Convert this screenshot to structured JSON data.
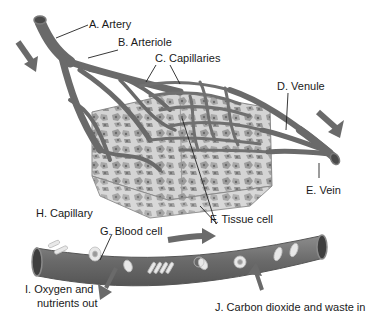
{
  "diagram": {
    "colors": {
      "vessel": "#6e6e6e",
      "vessel_dark": "#4a4a4a",
      "vessel_light": "#8a8a8a",
      "tissue_fill": "#c9c9c9",
      "tissue_cell": "#9a9a9a",
      "arrow": "#6a6a6a",
      "blood_cell": "#e6e6e6",
      "label_text": "#1a1a1a",
      "leader_line": "#222222"
    },
    "labels": {
      "artery": "A. Artery",
      "arteriole": "B. Arteriole",
      "capillaries": "C. Capillaries",
      "venule": "D. Venule",
      "vein": "E. Vein",
      "tissue_cell": "F. Tissue cell",
      "blood_cell": "G. Blood cell",
      "capillary": "H. Capillary",
      "oxygen_line1": "I.  Oxygen and",
      "oxygen_line2": "nutrients out",
      "carbon": "J. Carbon dioxide and waste in"
    },
    "arrows": [
      {
        "name": "inflow-arrow",
        "direction": "down-right"
      },
      {
        "name": "outflow-arrow",
        "direction": "down-right"
      },
      {
        "name": "capillary-flow-arrow",
        "direction": "right"
      },
      {
        "name": "oxygen-out-arrow",
        "direction": "down-left"
      },
      {
        "name": "waste-in-arrow",
        "direction": "up"
      }
    ]
  }
}
